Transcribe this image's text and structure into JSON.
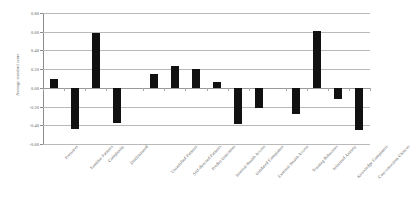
{
  "chart_data": {
    "type": "bar",
    "title": "",
    "xlabel": "",
    "ylabel": "Average standard score",
    "ylim": [
      -0.6,
      0.8
    ],
    "ytick_labels": [
      "0.80",
      "0.60",
      "0.40",
      "0.20",
      "0.00",
      "-0.20",
      "-0.40",
      "-0.60"
    ],
    "ytick_values": [
      0.8,
      0.6,
      0.4,
      0.2,
      0.0,
      -0.2,
      -0.4,
      -0.6
    ],
    "grid": true,
    "legend": "none",
    "bar_color": "#111111",
    "categories": [
      "Pressures",
      "Familiar Patients",
      "Complexity",
      "Disillusioned",
      "Unsatisfied Patients",
      "Self-directed Patients",
      "Predict Outcomes",
      "Internal Health Access",
      "Outdated Complaints",
      "External Health Access",
      "Treating Behaviors",
      "Informed Anxiety",
      "Knowledge Complaints",
      "Cost-conscious Choices"
    ],
    "values": [
      0.1,
      -0.44,
      0.59,
      -0.38,
      0.15,
      0.23,
      0.2,
      0.06,
      -0.39,
      -0.22,
      -0.28,
      0.61,
      -0.12,
      -0.45
    ],
    "group_breaks_after": [
      4,
      10
    ]
  }
}
